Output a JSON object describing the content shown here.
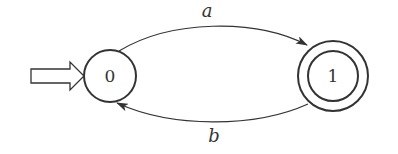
{
  "diagram": {
    "type": "finite-automaton",
    "stroke_color": "#333333",
    "background": "#ffffff",
    "initial_state": "0",
    "states": [
      {
        "id": "0",
        "label": "0",
        "accepting": false,
        "initial": true
      },
      {
        "id": "1",
        "label": "1",
        "accepting": true,
        "initial": false
      }
    ],
    "transitions": [
      {
        "from": "0",
        "to": "1",
        "label": "a"
      },
      {
        "from": "1",
        "to": "0",
        "label": "b"
      }
    ]
  }
}
